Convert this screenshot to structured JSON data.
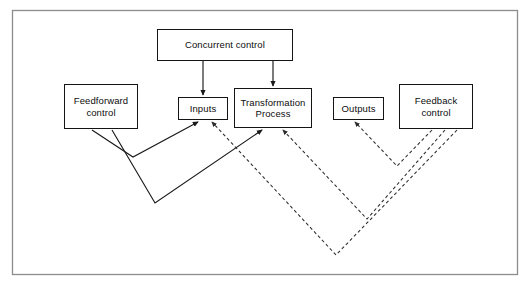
{
  "diagram": {
    "frame": {
      "name": "outer-frame",
      "x": 12,
      "y": 10,
      "width": 506,
      "height": 265,
      "stroke": "#8c8c8c",
      "fill": "#ffffff"
    },
    "colors": {
      "box_stroke": "#141414",
      "box_fill": "#ffffff",
      "text": "#0d0d0d",
      "solid_line": "#1a1a1a",
      "dashed_line": "#2b2b2b",
      "frame_stroke": "#8c8c8c"
    },
    "nodes": [
      {
        "id": "concurrent-control",
        "label": "Concurrent control",
        "x": 157,
        "y": 29,
        "width": 136,
        "height": 32,
        "font_size": 9.5
      },
      {
        "id": "feedforward-control",
        "label": "Feedforward\ncontrol",
        "x": 64,
        "y": 84,
        "width": 74,
        "height": 45,
        "font_size": 9.5
      },
      {
        "id": "inputs",
        "label": "Inputs",
        "x": 178,
        "y": 97,
        "width": 50,
        "height": 23,
        "font_size": 9.5
      },
      {
        "id": "transformation-process",
        "label": "Transformation\nProcess",
        "x": 234,
        "y": 88,
        "width": 78,
        "height": 40,
        "font_size": 9.5
      },
      {
        "id": "outputs",
        "label": "Outputs",
        "x": 333,
        "y": 97,
        "width": 51,
        "height": 23,
        "font_size": 9.5
      },
      {
        "id": "feedback-control",
        "label": "Feedback\ncontrol",
        "x": 399,
        "y": 84,
        "width": 74,
        "height": 45,
        "font_size": 9.5
      }
    ],
    "connectors": [
      {
        "id": "concurrent-to-inputs",
        "style": "solid",
        "from": "concurrent-control",
        "to": "inputs",
        "arrow": true,
        "points": "203,61 203,95"
      },
      {
        "id": "concurrent-to-transformation",
        "style": "solid",
        "from": "concurrent-control",
        "to": "transformation-process",
        "arrow": true,
        "points": "273,61 273,86"
      },
      {
        "id": "feedforward-to-inputs",
        "style": "solid",
        "from": "feedforward-control",
        "to": "inputs",
        "arrow": true,
        "points": "92,130 133,157 198,122"
      },
      {
        "id": "feedforward-to-transformation",
        "style": "solid",
        "from": "feedforward-control",
        "to": "transformation-process",
        "arrow": true,
        "points": "112,130 155,203 262,130"
      },
      {
        "id": "feedback-to-outputs",
        "style": "dashed",
        "from": "feedback-control",
        "to": "outputs",
        "arrow": true,
        "points": "432,130 397,166 355,122"
      },
      {
        "id": "feedback-to-transformation",
        "style": "dashed",
        "from": "feedback-control",
        "to": "transformation-process",
        "arrow": true,
        "points": "445,130 367,219 283,130"
      },
      {
        "id": "feedback-to-inputs",
        "style": "dashed",
        "from": "feedback-control",
        "to": "inputs",
        "arrow": true,
        "points": "457,130 336,255 212,122"
      }
    ]
  }
}
